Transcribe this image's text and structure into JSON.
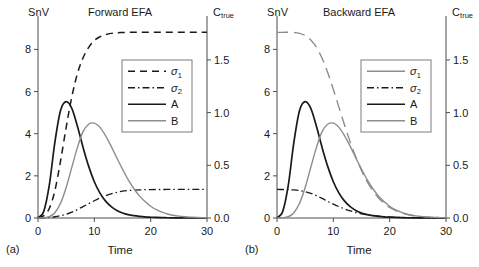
{
  "figure": {
    "panels": [
      {
        "tag": "(a)",
        "title": "Forward EFA",
        "left_axis_label": "SnV",
        "right_axis_label_base": "C",
        "right_axis_label_sub": "true",
        "xlabel": "Time",
        "yticks": [
          "0",
          "2",
          "4",
          "6",
          "8"
        ],
        "y2ticks": [
          "0.0",
          "0.5",
          "1.0",
          "1.5"
        ],
        "xticks": [
          "0",
          "10",
          "20",
          "30"
        ],
        "legend": [
          {
            "label_base": "σ",
            "label_sub": "1",
            "style": "dashed-black"
          },
          {
            "label_base": "σ",
            "label_sub": "2",
            "style": "dashdot-black"
          },
          {
            "label_base": "A",
            "label_sub": "",
            "style": "solid-black"
          },
          {
            "label_base": "B",
            "label_sub": "",
            "style": "solid-gray"
          }
        ]
      },
      {
        "tag": "(b)",
        "title": "Backward EFA",
        "left_axis_label": "SnV",
        "right_axis_label_base": "C",
        "right_axis_label_sub": "true",
        "xlabel": "Time",
        "yticks": [
          "0",
          "2",
          "4",
          "6",
          "8"
        ],
        "y2ticks": [
          "0.0",
          "0.5",
          "1.0",
          "1.5"
        ],
        "xticks": [
          "0",
          "10",
          "20",
          "30"
        ],
        "legend": [
          {
            "label_base": "σ",
            "label_sub": "1",
            "style": "solid-gray"
          },
          {
            "label_base": "σ",
            "label_sub": "2",
            "style": "dashdot-black"
          },
          {
            "label_base": "A",
            "label_sub": "",
            "style": "solid-black"
          },
          {
            "label_base": "B",
            "label_sub": "",
            "style": "solid-gray"
          }
        ]
      }
    ]
  },
  "chart_data": [
    {
      "type": "line",
      "title": "Forward EFA",
      "panel": "(a)",
      "xlabel": "Time",
      "ylabel": "SnV",
      "y2label": "C_true",
      "xlim": [
        0,
        30
      ],
      "ylim": [
        0,
        9.3
      ],
      "y2lim": [
        0.0,
        1.86
      ],
      "xticks": [
        0,
        10,
        20,
        30
      ],
      "yticks": [
        0,
        2,
        4,
        6,
        8
      ],
      "y2ticks": [
        0.0,
        0.5,
        1.0,
        1.5
      ],
      "grid": false,
      "legend_position": "upper-center-right",
      "x": [
        0,
        1,
        2,
        3,
        4,
        5,
        6,
        7,
        8,
        9,
        10,
        11,
        12,
        13,
        14,
        15,
        16,
        17,
        18,
        19,
        20,
        21,
        22,
        23,
        24,
        25,
        26,
        27,
        28,
        29,
        30
      ],
      "series": [
        {
          "name": "σ1",
          "axis": "left",
          "style": "dashed-black",
          "values": [
            0.02,
            0.1,
            0.45,
            1.3,
            2.7,
            4.3,
            5.75,
            6.85,
            7.6,
            8.1,
            8.42,
            8.6,
            8.7,
            8.76,
            8.79,
            8.8,
            8.81,
            8.81,
            8.81,
            8.81,
            8.81,
            8.81,
            8.81,
            8.81,
            8.81,
            8.81,
            8.81,
            8.81,
            8.81,
            8.81,
            8.81
          ]
        },
        {
          "name": "σ2",
          "axis": "left",
          "style": "dashdot-black",
          "values": [
            0.0,
            0.01,
            0.03,
            0.06,
            0.11,
            0.18,
            0.28,
            0.4,
            0.54,
            0.68,
            0.82,
            0.95,
            1.06,
            1.15,
            1.22,
            1.27,
            1.3,
            1.32,
            1.335,
            1.345,
            1.35,
            1.352,
            1.353,
            1.354,
            1.355,
            1.355,
            1.355,
            1.355,
            1.355,
            1.355,
            1.355
          ]
        },
        {
          "name": "A",
          "axis": "left",
          "style": "solid-black",
          "values": [
            0.02,
            0.3,
            1.55,
            3.6,
            5.1,
            5.52,
            5.2,
            4.35,
            3.35,
            2.45,
            1.72,
            1.18,
            0.8,
            0.54,
            0.36,
            0.24,
            0.16,
            0.11,
            0.075,
            0.05,
            0.035,
            0.025,
            0.018,
            0.013,
            0.009,
            0.007,
            0.005,
            0.004,
            0.003,
            0.002,
            0.002
          ]
        },
        {
          "name": "B",
          "axis": "left",
          "style": "solid-gray",
          "values": [
            0.0,
            0.01,
            0.06,
            0.25,
            0.7,
            1.45,
            2.4,
            3.35,
            4.1,
            4.45,
            4.5,
            4.3,
            3.9,
            3.4,
            2.85,
            2.32,
            1.82,
            1.4,
            1.05,
            0.78,
            0.56,
            0.4,
            0.28,
            0.19,
            0.13,
            0.09,
            0.06,
            0.04,
            0.03,
            0.02,
            0.015
          ]
        }
      ]
    },
    {
      "type": "line",
      "title": "Backward EFA",
      "panel": "(b)",
      "xlabel": "Time",
      "ylabel": "SnV",
      "y2label": "C_true",
      "xlim": [
        0,
        30
      ],
      "ylim": [
        0,
        9.3
      ],
      "y2lim": [
        0.0,
        1.86
      ],
      "xticks": [
        0,
        10,
        20,
        30
      ],
      "yticks": [
        0,
        2,
        4,
        6,
        8
      ],
      "y2ticks": [
        0.0,
        0.5,
        1.0,
        1.5
      ],
      "grid": false,
      "legend_position": "upper-center-right",
      "x": [
        0,
        1,
        2,
        3,
        4,
        5,
        6,
        7,
        8,
        9,
        10,
        11,
        12,
        13,
        14,
        15,
        16,
        17,
        18,
        19,
        20,
        21,
        22,
        23,
        24,
        25,
        26,
        27,
        28,
        29,
        30
      ],
      "series": [
        {
          "name": "σ1",
          "axis": "left",
          "style": "longdash-gray",
          "values": [
            8.81,
            8.81,
            8.81,
            8.8,
            8.76,
            8.66,
            8.45,
            8.1,
            7.58,
            6.9,
            6.1,
            5.25,
            4.4,
            3.6,
            2.88,
            2.25,
            1.72,
            1.3,
            0.96,
            0.7,
            0.5,
            0.36,
            0.25,
            0.17,
            0.12,
            0.08,
            0.055,
            0.038,
            0.026,
            0.018,
            0.012
          ]
        },
        {
          "name": "σ2",
          "axis": "left",
          "style": "dashdot-black",
          "values": [
            1.355,
            1.352,
            1.345,
            1.33,
            1.3,
            1.25,
            1.17,
            1.06,
            0.93,
            0.79,
            0.66,
            0.54,
            0.43,
            0.34,
            0.26,
            0.2,
            0.155,
            0.115,
            0.086,
            0.064,
            0.047,
            0.034,
            0.025,
            0.018,
            0.013,
            0.009,
            0.007,
            0.005,
            0.004,
            0.003,
            0.002
          ]
        },
        {
          "name": "A",
          "axis": "left",
          "style": "solid-black",
          "values": [
            0.02,
            0.3,
            1.55,
            3.6,
            5.1,
            5.52,
            5.2,
            4.35,
            3.35,
            2.45,
            1.72,
            1.18,
            0.8,
            0.54,
            0.36,
            0.24,
            0.16,
            0.11,
            0.075,
            0.05,
            0.035,
            0.025,
            0.018,
            0.013,
            0.009,
            0.007,
            0.005,
            0.004,
            0.003,
            0.002,
            0.002
          ]
        },
        {
          "name": "B",
          "axis": "left",
          "style": "solid-gray",
          "values": [
            0.0,
            0.01,
            0.06,
            0.25,
            0.7,
            1.45,
            2.4,
            3.35,
            4.1,
            4.45,
            4.5,
            4.3,
            3.9,
            3.4,
            2.85,
            2.32,
            1.82,
            1.4,
            1.05,
            0.78,
            0.56,
            0.4,
            0.28,
            0.19,
            0.13,
            0.09,
            0.06,
            0.04,
            0.03,
            0.02,
            0.015
          ]
        }
      ]
    }
  ],
  "colors": {
    "black": "#1a1a1a",
    "gray": "#8c8c8c",
    "axis": "#4d4d4d",
    "legend_border": "#7c7c7c"
  }
}
